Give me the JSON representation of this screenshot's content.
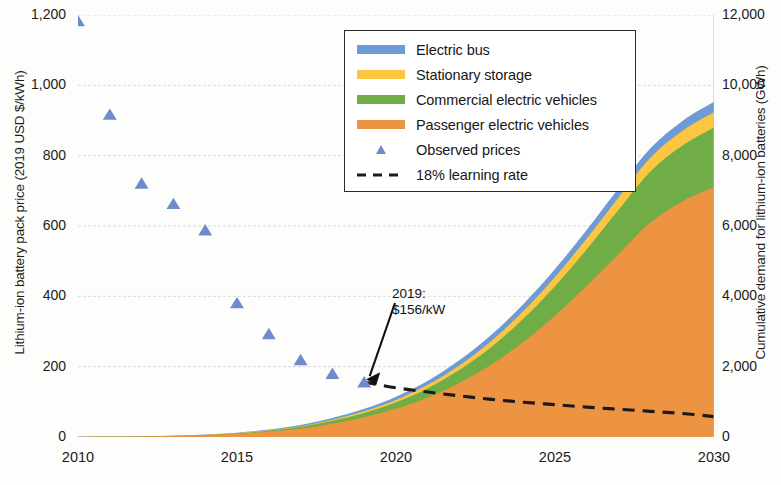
{
  "chart_data": {
    "type": "area",
    "title": "",
    "subtitle": "",
    "xlabel": "",
    "x_ticks": [
      "2010",
      "2015",
      "2020",
      "2025",
      "2030"
    ],
    "x_tick_values": [
      2010,
      2015,
      2020,
      2025,
      2030
    ],
    "xlim": [
      2010,
      2030
    ],
    "grid": true,
    "legend_position": "top-center",
    "axes": [
      {
        "id": "left",
        "ylabel": "Lithium-ion battery pack price (2019 USD $/kWh)",
        "ylim": [
          0,
          1200
        ],
        "y_ticks": [
          "0",
          "200",
          "400",
          "600",
          "800",
          "1,000",
          "1,200"
        ],
        "y_tick_values": [
          0,
          200,
          400,
          600,
          800,
          1000,
          1200
        ]
      },
      {
        "id": "right",
        "ylabel": "Cumulative demand for lithium-ion batteries (GWh)",
        "ylim": [
          0,
          12000
        ],
        "y_ticks": [
          "0",
          "2,000",
          "4,000",
          "6,000",
          "8,000",
          "10,000",
          "12,000"
        ],
        "y_tick_values": [
          0,
          2000,
          4000,
          6000,
          8000,
          10000,
          12000
        ]
      }
    ],
    "x": [
      2010,
      2011,
      2012,
      2013,
      2014,
      2015,
      2016,
      2017,
      2018,
      2019,
      2020,
      2021,
      2022,
      2023,
      2024,
      2025,
      2026,
      2027,
      2028,
      2029,
      2030
    ],
    "stacked_series": [
      {
        "name": "Passenger electric vehicles",
        "color": "#ED9442",
        "axis": "right",
        "units": "GWh",
        "values": [
          2,
          6,
          14,
          28,
          52,
          90,
          150,
          240,
          380,
          560,
          800,
          1120,
          1540,
          2060,
          2700,
          3450,
          4300,
          5200,
          6100,
          6700,
          7100
        ]
      },
      {
        "name": "Commercial electric vehicles",
        "color": "#70AD47",
        "axis": "right",
        "units": "GWh",
        "values": [
          0,
          1,
          2,
          4,
          8,
          15,
          28,
          48,
          80,
          125,
          185,
          265,
          370,
          500,
          660,
          840,
          1040,
          1260,
          1450,
          1580,
          1700
        ]
      },
      {
        "name": "Stationary storage",
        "color": "#FBC641",
        "axis": "right",
        "units": "GWh",
        "values": [
          0,
          0,
          1,
          2,
          4,
          7,
          12,
          20,
          32,
          48,
          70,
          98,
          132,
          172,
          216,
          262,
          308,
          352,
          390,
          420,
          440
        ]
      },
      {
        "name": "Electric bus",
        "color": "#6E9BD6",
        "axis": "right",
        "units": "GWh",
        "values": [
          0,
          1,
          2,
          4,
          7,
          12,
          20,
          32,
          48,
          68,
          92,
          118,
          146,
          174,
          200,
          224,
          244,
          260,
          272,
          282,
          290
        ]
      }
    ],
    "scatter_series": {
      "name": "Observed prices",
      "color": "#6e8ccb",
      "marker": "triangle",
      "axis": "left",
      "units": "2019 USD $/kWh",
      "x": [
        2010,
        2011,
        2012,
        2013,
        2014,
        2015,
        2016,
        2017,
        2018,
        2019
      ],
      "values": [
        1183,
        917,
        721,
        663,
        588,
        381,
        293,
        219,
        180,
        156
      ]
    },
    "line_series": {
      "name": "18% learning rate",
      "color": "#1a1a1a",
      "style": "dashed",
      "axis": "left",
      "units": "2019 USD $/kWh",
      "x": [
        2019,
        2020,
        2021,
        2022,
        2023,
        2024,
        2025,
        2026,
        2027,
        2028,
        2029,
        2030
      ],
      "values": [
        156,
        140,
        128,
        117,
        107,
        99,
        92,
        85,
        79,
        73,
        67,
        58
      ]
    },
    "annotations": [
      {
        "text_line1": "2019:",
        "text_line2": "$156/kW",
        "points_to_x": 2019,
        "points_to_y": 156
      }
    ],
    "legend": [
      {
        "label": "Electric bus",
        "color": "#6E9BD6",
        "type": "swatch"
      },
      {
        "label": "Stationary storage",
        "color": "#FBC641",
        "type": "swatch"
      },
      {
        "label": "Commercial electric vehicles",
        "color": "#70AD47",
        "type": "swatch"
      },
      {
        "label": "Passenger electric vehicles",
        "color": "#ED9442",
        "type": "swatch"
      },
      {
        "label": "Observed prices",
        "color": "#6e8ccb",
        "type": "marker"
      },
      {
        "label": "18% learning rate",
        "color": "#1a1a1a",
        "type": "dash"
      }
    ]
  }
}
